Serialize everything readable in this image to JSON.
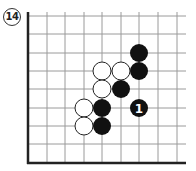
{
  "problem": {
    "number_label": "14"
  },
  "board": {
    "grid_color": "#9a9a9a",
    "edge_color": "#222222",
    "columns_x": [
      28,
      47,
      65,
      84,
      102,
      121,
      139,
      158,
      177
    ],
    "rows_y": [
      16,
      34,
      53,
      71,
      89,
      108,
      126,
      144,
      163
    ],
    "top_y": 12,
    "right_x": 186,
    "edges": [
      "left",
      "bottom"
    ]
  },
  "stones": [
    {
      "color": "black",
      "col": 6,
      "row": 2,
      "label": ""
    },
    {
      "color": "black",
      "col": 6,
      "row": 3,
      "label": ""
    },
    {
      "color": "white",
      "col": 4,
      "row": 3,
      "label": ""
    },
    {
      "color": "white",
      "col": 5,
      "row": 3,
      "label": ""
    },
    {
      "color": "white",
      "col": 4,
      "row": 4,
      "label": ""
    },
    {
      "color": "black",
      "col": 5,
      "row": 4,
      "label": ""
    },
    {
      "color": "white",
      "col": 3,
      "row": 5,
      "label": ""
    },
    {
      "color": "black",
      "col": 4,
      "row": 5,
      "label": ""
    },
    {
      "color": "black",
      "col": 6,
      "row": 5,
      "label": "1"
    },
    {
      "color": "white",
      "col": 3,
      "row": 6,
      "label": ""
    },
    {
      "color": "black",
      "col": 4,
      "row": 6,
      "label": ""
    }
  ],
  "stone_style": {
    "radius": 9,
    "black_fill": "#111111",
    "white_fill": "#ffffff",
    "white_stroke": "#222222",
    "label_color": "#ffffff"
  }
}
